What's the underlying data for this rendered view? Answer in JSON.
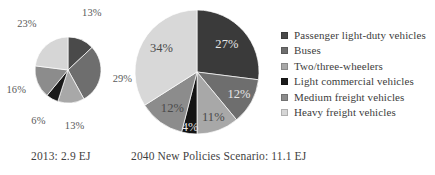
{
  "chart_data": [
    {
      "type": "pie",
      "name": "transport-energy-2013",
      "title": "2013: 2.9 EJ",
      "caption": "2013: 2.9 EJ",
      "total_label": "2.9 EJ",
      "year": "2013",
      "unit": "EJ",
      "legend_position": "right-shared",
      "start_angle_deg": 0,
      "direction": "clockwise",
      "categories": [
        "Passenger light-duty vehicles",
        "Buses",
        "Two/three-wheelers",
        "Light commercial vehicles",
        "Medium freight vehicles",
        "Heavy freight vehicles"
      ],
      "values": [
        13,
        29,
        13,
        6,
        16,
        23
      ],
      "labels": [
        "13%",
        "29%",
        "13%",
        "6%",
        "16%",
        "23%"
      ],
      "colors": [
        "#4a4a4a",
        "#6e6e6e",
        "#a8a8a8",
        "#1a1a1a",
        "#8c8c8c",
        "#d6d6d6"
      ]
    },
    {
      "type": "pie",
      "name": "transport-energy-2040",
      "title": "2040 New Policies Scenario: 11.1 EJ",
      "caption": "2040 New Policies Scenario: 11.1 EJ",
      "total_label": "11.1 EJ",
      "year": "2040",
      "scenario": "New Policies Scenario",
      "unit": "EJ",
      "legend_position": "right-shared",
      "start_angle_deg": 0,
      "direction": "clockwise",
      "categories": [
        "Passenger light-duty vehicles",
        "Buses",
        "Two/three-wheelers",
        "Light commercial vehicles",
        "Medium freight vehicles",
        "Heavy freight vehicles"
      ],
      "values": [
        27,
        12,
        11,
        4,
        12,
        34
      ],
      "labels": [
        "27%",
        "12%",
        "11%",
        "4%",
        "12%",
        "34%"
      ],
      "colors": [
        "#3a3a3a",
        "#6e6e6e",
        "#a8a8a8",
        "#141414",
        "#8c8c8c",
        "#d8d8d8"
      ]
    }
  ],
  "legend": {
    "items": [
      {
        "label": "Passenger light-duty vehicles",
        "color": "#4a4a4a"
      },
      {
        "label": "Buses",
        "color": "#6e6e6e"
      },
      {
        "label": "Two/three-wheelers",
        "color": "#a8a8a8"
      },
      {
        "label": "Light commercial vehicles",
        "color": "#1a1a1a"
      },
      {
        "label": "Medium freight vehicles",
        "color": "#8c8c8c"
      },
      {
        "label": "Heavy freight vehicles",
        "color": "#d6d6d6"
      }
    ]
  },
  "captions": {
    "left": "2013: 2.9 EJ",
    "right": "2040 New Policies Scenario: 11.1 EJ"
  },
  "colors": {
    "background": "#ffffff",
    "text": "#3d3d3d",
    "label_on_dark": "#e6e6e6",
    "label_on_light": "#4a4a4a"
  }
}
